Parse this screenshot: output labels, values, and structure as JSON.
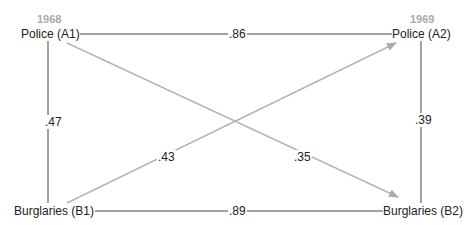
{
  "diagram": {
    "type": "cross-lagged panel",
    "years": {
      "left": "1968",
      "right": "1969"
    },
    "nodes": {
      "a1": "Police (A1)",
      "a2": "Police (A2)",
      "b1": "Burglaries (B1)",
      "b2": "Burglaries (B2)"
    },
    "edges": [
      {
        "from": "A1",
        "to": "A2",
        "coef": ".86",
        "style": "line"
      },
      {
        "from": "B1",
        "to": "B2",
        "coef": ".89",
        "style": "line"
      },
      {
        "from": "A1",
        "to": "B1",
        "coef": ".47",
        "style": "line"
      },
      {
        "from": "A2",
        "to": "B2",
        "coef": ".39",
        "style": "line"
      },
      {
        "from": "B1",
        "to": "A2",
        "coef": ".43",
        "style": "arrow"
      },
      {
        "from": "A1",
        "to": "B2",
        "coef": ".35",
        "style": "arrow"
      }
    ],
    "colors": {
      "line": "#333333",
      "arrow": "#b0b0b0",
      "year": "#aaaaaa"
    }
  }
}
